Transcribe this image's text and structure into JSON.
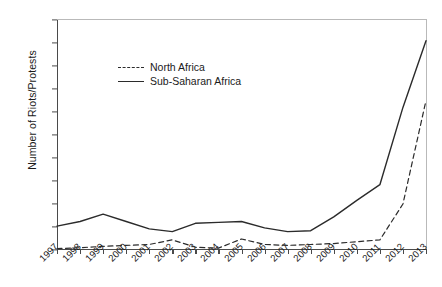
{
  "chart_data": {
    "type": "line",
    "title": "",
    "xlabel": "",
    "ylabel": "Number of Riots/Protests",
    "categories": [
      "1997",
      "1998",
      "1999",
      "2000",
      "2001",
      "2002",
      "2003",
      "2004",
      "2005",
      "2006",
      "2007",
      "2008",
      "2009",
      "2010",
      "2011",
      "2012",
      "2013"
    ],
    "x": [
      1997,
      1998,
      1999,
      2000,
      2001,
      2002,
      2003,
      2004,
      2005,
      2006,
      2007,
      2008,
      2009,
      2010,
      2011,
      2012,
      2013
    ],
    "ylim": [
      0,
      500
    ],
    "yticks": [
      0,
      50,
      100,
      150,
      200,
      250,
      300,
      350,
      400,
      450,
      500
    ],
    "grid": false,
    "legend_position": "upper-left-inside",
    "series": [
      {
        "name": "North Africa",
        "style": "dashed",
        "color": "#2b2b2b",
        "values": [
          3,
          5,
          8,
          10,
          12,
          22,
          6,
          4,
          24,
          12,
          10,
          12,
          14,
          18,
          22,
          100,
          325
        ]
      },
      {
        "name": "Sub-Saharan Africa",
        "style": "solid",
        "color": "#2b2b2b",
        "values": [
          52,
          62,
          78,
          62,
          46,
          40,
          58,
          60,
          62,
          48,
          40,
          42,
          72,
          108,
          142,
          310,
          455
        ]
      }
    ]
  },
  "legend": {
    "items": [
      {
        "label": "North Africa",
        "style": "dashed"
      },
      {
        "label": "Sub-Saharan Africa",
        "style": "solid"
      }
    ]
  }
}
